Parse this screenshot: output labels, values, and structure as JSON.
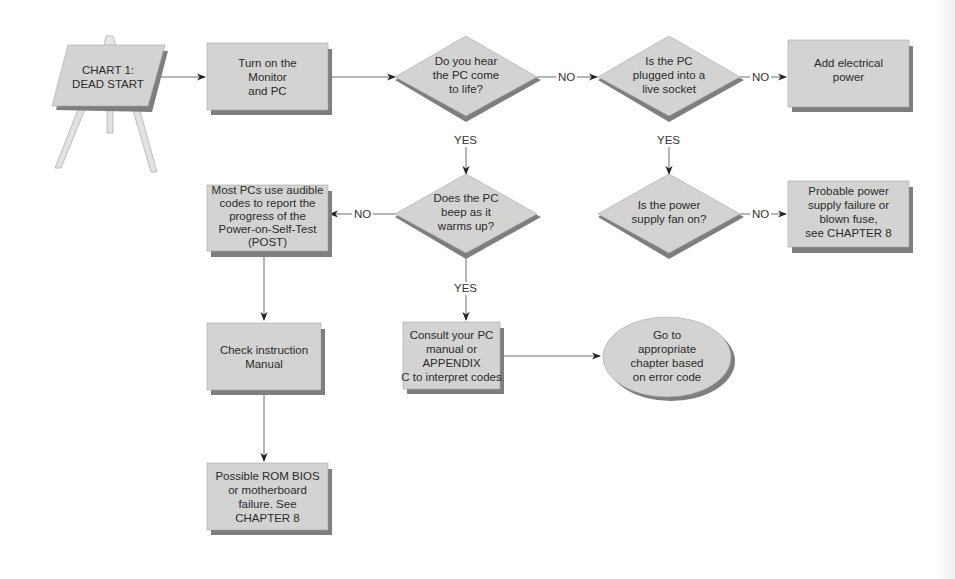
{
  "chart_title": "CHART 1:\nDEAD START",
  "colors": {
    "node_fill": "#d3d3d1",
    "node_shadow": "#7e7e7e",
    "line": "#6e6e6e",
    "text": "#2b2b2b",
    "easel_leg": "#e2e2e0"
  },
  "nodes": {
    "start": {
      "shape": "easel",
      "text": "CHART 1:\nDEAD START"
    },
    "turn_on": {
      "shape": "rect",
      "text": "Turn on the\nMonitor\nand PC"
    },
    "hear_pc": {
      "shape": "diamond",
      "text": "Do you hear\nthe PC come\nto life?"
    },
    "plugged_in": {
      "shape": "diamond",
      "text": "Is the PC\nplugged into a\nlive socket"
    },
    "add_power": {
      "shape": "rect",
      "text": "Add electrical\npower"
    },
    "beep": {
      "shape": "diamond",
      "text": "Does the PC\nbeep as it\nwarms up?"
    },
    "audible_codes": {
      "shape": "rect",
      "text": "Most PCs use audible\ncodes to report the\nprogress of the\nPower-on-Self-Test\n(POST)"
    },
    "fan_on": {
      "shape": "diamond",
      "text": "Is the power\nsupply fan on?"
    },
    "psu_failure": {
      "shape": "rect",
      "text": "Probable power\nsupply failure or\nblown fuse,\nsee CHAPTER 8"
    },
    "check_manual": {
      "shape": "rect",
      "text": "Check instruction\nManual"
    },
    "consult_manual": {
      "shape": "rect",
      "text": "Consult your PC\nmanual or APPENDIX\nC to interpret codes"
    },
    "goto_chapter": {
      "shape": "ellipse",
      "text": "Go to\nappropriate\nchapter based\non error code"
    },
    "rom_bios": {
      "shape": "rect",
      "text": "Possible ROM BIOS\nor motherboard\nfailure. See\nCHAPTER 8"
    }
  },
  "edges": [
    {
      "from": "start",
      "to": "turn_on",
      "label": ""
    },
    {
      "from": "turn_on",
      "to": "hear_pc",
      "label": ""
    },
    {
      "from": "hear_pc",
      "to": "plugged_in",
      "label": "NO"
    },
    {
      "from": "plugged_in",
      "to": "add_power",
      "label": "NO"
    },
    {
      "from": "hear_pc",
      "to": "beep",
      "label": "YES"
    },
    {
      "from": "plugged_in",
      "to": "fan_on",
      "label": "YES"
    },
    {
      "from": "beep",
      "to": "audible_codes",
      "label": "NO"
    },
    {
      "from": "fan_on",
      "to": "psu_failure",
      "label": "NO"
    },
    {
      "from": "beep",
      "to": "consult_manual",
      "label": "YES"
    },
    {
      "from": "audible_codes",
      "to": "check_manual",
      "label": ""
    },
    {
      "from": "consult_manual",
      "to": "goto_chapter",
      "label": ""
    },
    {
      "from": "check_manual",
      "to": "rom_bios",
      "label": ""
    }
  ],
  "edge_labels": {
    "no_1": "NO",
    "no_2": "NO",
    "yes_1": "YES",
    "yes_2": "YES",
    "no_3": "NO",
    "no_4": "NO",
    "yes_3": "YES"
  }
}
